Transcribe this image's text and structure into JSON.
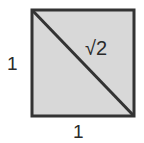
{
  "diagram": {
    "type": "unit-square-with-diagonal",
    "labels": {
      "diagonal": "√2",
      "left_side": "1",
      "bottom_side": "1"
    },
    "colors": {
      "fill": "#d8d8d8",
      "stroke": "#333333",
      "text": "#2a2a2a"
    }
  }
}
